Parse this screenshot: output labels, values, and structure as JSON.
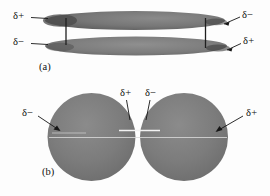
{
  "figure": {
    "background_color": "#fdfdfd",
    "ink_color": "#0d0d0d",
    "shape_fill_dark": "#6f6f6f",
    "shape_fill_mid": "#7b7b7b",
    "shape_edge_dark": "#3a3a3a",
    "highlight_color": "#efefef"
  },
  "panel_a": {
    "caption": "(a)",
    "label_top_left": "δ+",
    "label_top_right": "δ−",
    "label_bottom_left": "δ−",
    "label_bottom_right": "δ+",
    "shape_type": "ellipse",
    "shape_count": 2
  },
  "panel_b": {
    "caption": "(b)",
    "label_left": "δ−",
    "label_center_left": "δ+",
    "label_center_right": "δ−",
    "label_right": "δ+",
    "shape_type": "circle",
    "shape_count": 2
  }
}
